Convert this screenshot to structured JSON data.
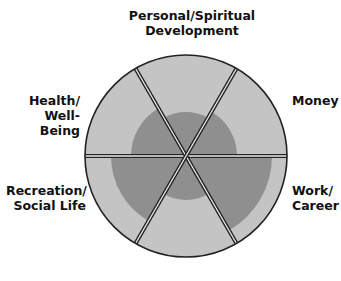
{
  "diagram": {
    "type": "wheel-of-life",
    "colors": {
      "outer": "#c4c4c4",
      "inner": "#8f8f8f",
      "outline": "#222222",
      "divider_fill": "#eeeeee"
    },
    "labels": {
      "personal": "Personal/Spiritual\nDevelopment",
      "money": "Money",
      "work": "Work/\nCareer",
      "recreation": "Recreation/\nSocial Life",
      "health": "Health/\nWell-Being"
    }
  },
  "chart_data": {
    "type": "radial-sectors",
    "center": [
      186,
      156
    ],
    "outer_radius": 101,
    "sectors": [
      {
        "name": "Personal/Spiritual Development",
        "start_deg": -120,
        "end_deg": -60,
        "radius": 44
      },
      {
        "name": "Money",
        "start_deg": -60,
        "end_deg": 0,
        "radius": 51
      },
      {
        "name": "Work/Career",
        "start_deg": 0,
        "end_deg": 60,
        "radius": 86
      },
      {
        "name": "(unlabeled bottom)",
        "start_deg": 60,
        "end_deg": 120,
        "radius": 44
      },
      {
        "name": "Recreation/Social Life",
        "start_deg": 120,
        "end_deg": 180,
        "radius": 75
      },
      {
        "name": "Health/Well-Being",
        "start_deg": 180,
        "end_deg": 240,
        "radius": 55
      }
    ]
  }
}
